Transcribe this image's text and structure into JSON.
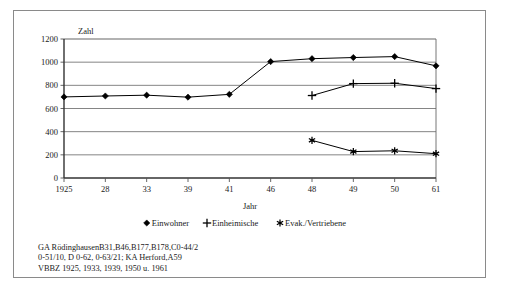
{
  "chart_data": {
    "type": "line",
    "title": "",
    "xlabel": "Jahr",
    "ylabel": "Zahl",
    "categories": [
      "1925",
      "28",
      "33",
      "39",
      "41",
      "46",
      "48",
      "49",
      "50",
      "61"
    ],
    "ylim": [
      0,
      1200
    ],
    "yticks": [
      0,
      200,
      400,
      600,
      800,
      1000,
      1200
    ],
    "grid": true,
    "legend_position": "bottom",
    "series": [
      {
        "name": "Einwohner",
        "marker": "diamond",
        "color": "#000000",
        "x": [
          "1925",
          "28",
          "33",
          "39",
          "41",
          "46",
          "48",
          "49",
          "50",
          "61"
        ],
        "values": [
          700,
          708,
          715,
          698,
          722,
          1005,
          1030,
          1040,
          1048,
          968
        ]
      },
      {
        "name": "Einheimische",
        "marker": "plus",
        "color": "#000000",
        "x": [
          "48",
          "49",
          "50",
          "61"
        ],
        "values": [
          712,
          815,
          818,
          772
        ]
      },
      {
        "name": "Evak./Vertriebene",
        "marker": "star",
        "color": "#000000",
        "x": [
          "48",
          "49",
          "50",
          "61"
        ],
        "values": [
          325,
          228,
          235,
          210
        ]
      }
    ]
  },
  "axis": {
    "y_label": "Zahl",
    "x_label": "Jahr",
    "y_ticks": [
      "1200",
      "1000",
      "800",
      "600",
      "400",
      "200",
      "0"
    ],
    "x_ticks": [
      "1925",
      "28",
      "33",
      "39",
      "41",
      "46",
      "48",
      "49",
      "50",
      "61"
    ]
  },
  "legend": {
    "items": [
      {
        "label": "Einwohner",
        "marker": "diamond"
      },
      {
        "label": "Einheimische",
        "marker": "plus"
      },
      {
        "label": "Evak./Vertriebene",
        "marker": "star"
      }
    ]
  },
  "footnote": {
    "line1": "GA RödinghausenB31,B46,B177,B178,C0-44/2",
    "line2": "0-51/10, D 0-62, 0-63/21; KA Herford,A59",
    "line3": "VBBZ 1925, 1933, 1939, 1950 u. 1961"
  },
  "colors": {
    "frame": "#8a8a8a",
    "axis": "#555555",
    "grid": "#666666",
    "series": "#000000",
    "background": "#ffffff"
  }
}
